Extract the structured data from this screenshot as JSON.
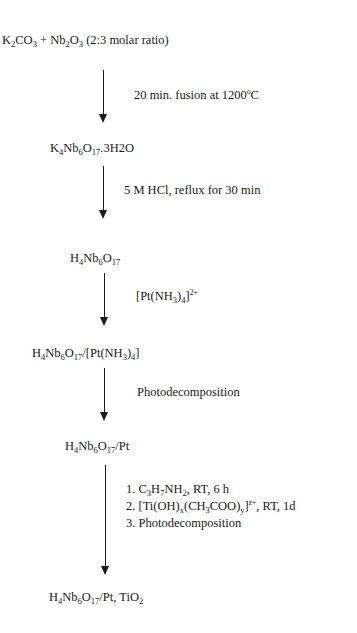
{
  "diagram": {
    "type": "synthesis-flowchart",
    "steps": [
      {
        "compound": "K2CO3 + Nb2O3 (2:3 molar ratio)"
      },
      {
        "compound": "K4Nb6O17.3H2O",
        "condition": "20 min. fusion at 1200°C"
      },
      {
        "compound": "H4Nb6O17",
        "condition": "5 M HCl, reflux for 30 min"
      },
      {
        "compound": "H4Nb6O17/[Pt(NH3)4]",
        "condition": "[Pt(NH3)4]2+"
      },
      {
        "compound": "H4Nb6O17/Pt",
        "condition": "Photodecomposition"
      },
      {
        "compound": "H4Nb6O17/Pt, TiO2",
        "condition": [
          "1. C3H7NH2, RT, 6 h",
          "2. [Ti(OH)x(CH3COO)y]z+, RT, 1d",
          "3. Photodecomposition"
        ]
      }
    ]
  },
  "parts": {
    "s1": {
      "a": "K",
      "a_sub": "2",
      "b": "CO",
      "b_sub": "3",
      "c": " + Nb",
      "c_sub": "2",
      "d": "O",
      "d_sub": "3",
      "e": " (2:3 molar ratio)"
    },
    "c1": {
      "a": "20 min. fusion at 1200",
      "deg": "o",
      "b": "C"
    },
    "s2": {
      "a": "K",
      "a_sub": "4",
      "b": "Nb",
      "b_sub": "6",
      "c": "O",
      "c_sub": "17",
      "d": ".3H2O"
    },
    "c2": {
      "text": "5 M HCl, reflux for 30 min"
    },
    "s3": {
      "a": "H",
      "a_sub": "4",
      "b": "Nb",
      "b_sub": "6",
      "c": "O",
      "c_sub": "17"
    },
    "c3": {
      "a": "[Pt(NH",
      "a_sub": "3",
      "b": ")",
      "b_sub": "4",
      "c": "]",
      "c_sup": "2+"
    },
    "s4": {
      "a": "H",
      "a_sub": "4",
      "b": "Nb",
      "b_sub": "6",
      "c": "O",
      "c_sub": "17",
      "d": "/[Pt(NH",
      "d_sub": "3",
      "e": ")",
      "e_sub": "4",
      "f": "]"
    },
    "c4": {
      "text": "Photodecomposition"
    },
    "s5": {
      "a": "H",
      "a_sub": "4",
      "b": "Nb",
      "b_sub": "6",
      "c": "O",
      "c_sub": "17",
      "d": "/Pt"
    },
    "c5": {
      "l1": {
        "a": "1. C",
        "a_sub": "3",
        "b": "H",
        "b_sub": "7",
        "c": "NH",
        "c_sub": "2",
        "d": ", RT, 6 h"
      },
      "l2": {
        "a": "2. [Ti(OH)",
        "a_sub": "x",
        "b": "(CH",
        "b_sub": "3",
        "c": "COO)",
        "c_sub": "y",
        "d": "]",
        "d_sup": "z+",
        "e": ", RT, 1d"
      },
      "l3": {
        "text": "3. Photodecomposition"
      }
    },
    "s6": {
      "a": "H",
      "a_sub": "4",
      "b": "Nb",
      "b_sub": "6",
      "c": "O",
      "c_sub": "17",
      "d": "/Pt, TiO",
      "d_sub": "2"
    }
  }
}
